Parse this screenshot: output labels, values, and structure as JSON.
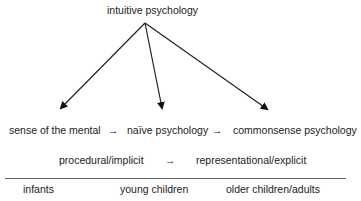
{
  "root": {
    "label": "intuitive psychology"
  },
  "stages": [
    {
      "label": "sense of the mental"
    },
    {
      "label": "naïve psychology"
    },
    {
      "label": "commonsense psychology"
    }
  ],
  "stage_arrow": "→",
  "modes": {
    "from": "procedural/implicit",
    "arrow": "→",
    "to": "representational/explicit"
  },
  "age_groups": [
    {
      "label": "infants"
    },
    {
      "label": "young children"
    },
    {
      "label": "older children/adults"
    }
  ],
  "colors": {
    "line": "#222222",
    "rule": "#666666",
    "text": "#222222"
  }
}
